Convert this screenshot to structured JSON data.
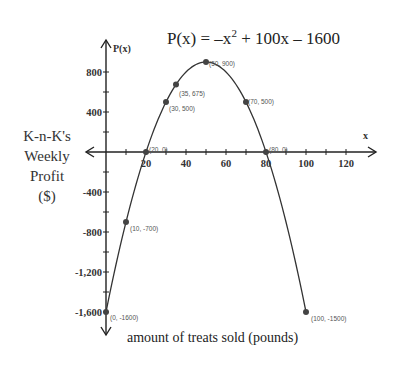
{
  "chart_data": {
    "type": "line",
    "equation": {
      "prefix": "P(x) = –x",
      "exponent": "2",
      "suffix": " + 100x – 1600"
    },
    "xlabel": "amount of treats sold (pounds)",
    "ylabel_lines": [
      "K-n-K's",
      "Weekly",
      "Profit",
      "($)"
    ],
    "x_axis_name": "x",
    "y_axis_name": "P(x)",
    "xlim": [
      0,
      130
    ],
    "ylim": [
      -1800,
      1000
    ],
    "x_ticks": [
      "20",
      "40",
      "60",
      "80",
      "100",
      "120"
    ],
    "y_ticks": [
      "800",
      "400",
      "-400",
      "-800",
      "-1,200",
      "-1,600"
    ],
    "grid": false,
    "series": [
      {
        "name": "P(x)",
        "curve": "parabola",
        "x_range": [
          0,
          100
        ]
      }
    ],
    "points": [
      {
        "x": 0,
        "y": -1600,
        "label": "(0, -1600)"
      },
      {
        "x": 10,
        "y": -700,
        "label": "(10, -700)"
      },
      {
        "x": 20,
        "y": 0,
        "label": "(20, 0)"
      },
      {
        "x": 30,
        "y": 500,
        "label": "(30, 500)"
      },
      {
        "x": 35,
        "y": 675,
        "label": "(35, 675)"
      },
      {
        "x": 50,
        "y": 900,
        "label": "(50, 900)"
      },
      {
        "x": 70,
        "y": 500,
        "label": "(70, 500)"
      },
      {
        "x": 80,
        "y": 0,
        "label": "(80, 0)"
      },
      {
        "x": 100,
        "y": -1600,
        "label": "(100, -1500)"
      }
    ]
  }
}
